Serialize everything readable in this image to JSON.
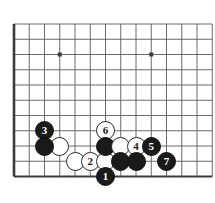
{
  "figure": {
    "kind": "go-board-diagram",
    "title": "",
    "board_background": "#ffffff",
    "line_color": "#595959",
    "border_color": "#3b3b3b",
    "black_color": "#1a1a1a",
    "white_color": "#ffffff"
  },
  "board": {
    "origin_x": 14,
    "origin_y": 24,
    "spacing": 15.25,
    "cols": 14,
    "rows": 11,
    "left_edge_bold": true,
    "bottom_edge_bold": true,
    "star_points": [
      {
        "col": 3,
        "row": 2
      },
      {
        "col": 9,
        "row": 2
      }
    ]
  },
  "stones": [
    {
      "id": "w-a",
      "color": "white",
      "label": "",
      "col": 3,
      "row": 8
    },
    {
      "id": "b-3",
      "color": "black",
      "label": "3",
      "col": 2,
      "row": 7
    },
    {
      "id": "b-a",
      "color": "black",
      "label": "",
      "col": 2,
      "row": 8
    },
    {
      "id": "w-b",
      "color": "white",
      "label": "",
      "col": 4,
      "row": 9
    },
    {
      "id": "w-2",
      "color": "white",
      "label": "2",
      "col": 5,
      "row": 9
    },
    {
      "id": "w-c",
      "color": "white",
      "label": "",
      "col": 6,
      "row": 9
    },
    {
      "id": "w-6",
      "color": "white",
      "label": "6",
      "col": 6,
      "row": 7
    },
    {
      "id": "b-b",
      "color": "black",
      "label": "",
      "col": 6,
      "row": 8
    },
    {
      "id": "w-d",
      "color": "white",
      "label": "",
      "col": 7,
      "row": 8
    },
    {
      "id": "w-4",
      "color": "white",
      "label": "4",
      "col": 8,
      "row": 8
    },
    {
      "id": "b-5",
      "color": "black",
      "label": "5",
      "col": 9,
      "row": 8
    },
    {
      "id": "b-c",
      "color": "black",
      "label": "",
      "col": 7,
      "row": 9
    },
    {
      "id": "b-d",
      "color": "black",
      "label": "",
      "col": 8,
      "row": 9
    },
    {
      "id": "b-7",
      "color": "black",
      "label": "7",
      "col": 10,
      "row": 9
    },
    {
      "id": "b-1",
      "color": "black",
      "label": "1",
      "col": 6,
      "row": 10
    }
  ],
  "move_sequence": [
    "1",
    "2",
    "3",
    "4",
    "5",
    "6",
    "7"
  ]
}
